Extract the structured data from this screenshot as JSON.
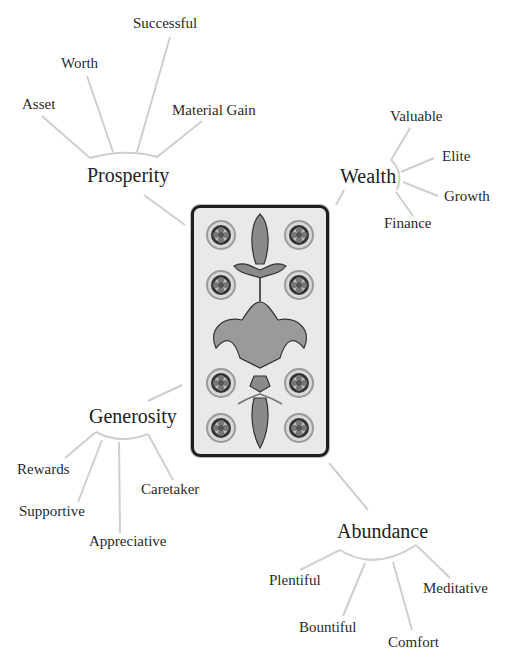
{
  "card": {
    "name": "Ten of Coins",
    "coin_count": 10
  },
  "clusters": [
    {
      "hub": "Prosperity",
      "branches": [
        "Asset",
        "Worth",
        "Successful",
        "Material Gain"
      ]
    },
    {
      "hub": "Wealth",
      "branches": [
        "Valuable",
        "Elite",
        "Growth",
        "Finance"
      ]
    },
    {
      "hub": "Generosity",
      "branches": [
        "Rewards",
        "Supportive",
        "Appreciative",
        "Caretaker"
      ]
    },
    {
      "hub": "Abundance",
      "branches": [
        "Plentiful",
        "Bountiful",
        "Comfort",
        "Meditative"
      ]
    }
  ],
  "colors": {
    "line": "#cfcfcf",
    "text": "#222222",
    "card_border": "#1e1e1e"
  }
}
